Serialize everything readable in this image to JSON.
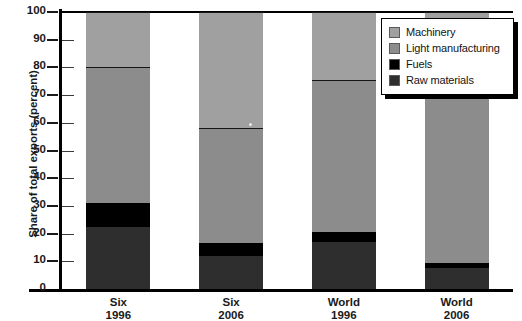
{
  "chart_data": {
    "type": "bar",
    "subtype": "stacked-bar",
    "title": "",
    "xlabel": "",
    "ylabel": "Share of total exports (percent)",
    "ylim": [
      0,
      100
    ],
    "yticks": [
      0,
      10,
      20,
      30,
      40,
      50,
      60,
      70,
      80,
      90,
      100
    ],
    "grid": false,
    "legend_position": "top-right",
    "categories": [
      "Six\n1996",
      "Six\n2006",
      "World\n1996",
      "World\n2006"
    ],
    "category_lines": [
      [
        "Six",
        "1996"
      ],
      [
        "Six",
        "2006"
      ],
      [
        "World",
        "1996"
      ],
      [
        "World",
        "2006"
      ]
    ],
    "stack_order_bottom_to_top": [
      "Raw materials",
      "Fuels",
      "Light manufacturing",
      "Machinery"
    ],
    "series": [
      {
        "name": "Raw materials",
        "color": "#2e2e2e",
        "values": [
          22.5,
          12.0,
          17.0,
          7.5
        ]
      },
      {
        "name": "Fuels",
        "color": "#000000",
        "values": [
          8.5,
          4.5,
          3.5,
          2.0
        ]
      },
      {
        "name": "Light manufacturing",
        "color": "#8c8c8c",
        "values": [
          49.0,
          41.5,
          55.0,
          60.5
        ]
      },
      {
        "name": "Machinery",
        "color": "#a0a0a0",
        "values": [
          20.0,
          42.0,
          24.5,
          30.0
        ]
      }
    ],
    "cumulative_tops": [
      {
        "category": "Six 1996",
        "raw_materials": 22.5,
        "fuels": 31.0,
        "light_manufacturing": 80.0,
        "machinery": 100
      },
      {
        "category": "Six 2006",
        "raw_materials": 12.0,
        "fuels": 16.5,
        "light_manufacturing": 58.0,
        "machinery": 100
      },
      {
        "category": "World 1996",
        "raw_materials": 17.0,
        "fuels": 20.5,
        "light_manufacturing": 75.5,
        "machinery": 100
      },
      {
        "category": "World 2006",
        "raw_materials": 7.5,
        "fuels": 9.5,
        "light_manufacturing": 70.0,
        "machinery": 100
      }
    ]
  },
  "legend": {
    "items": [
      {
        "label": "Machinery",
        "color": "#a0a0a0"
      },
      {
        "label": "Light manufacturing",
        "color": "#8c8c8c"
      },
      {
        "label": "Fuels",
        "color": "#000000"
      },
      {
        "label": "Raw materials",
        "color": "#2e2e2e"
      }
    ]
  },
  "axis": {
    "y_title": "Share of total exports (percent)",
    "y_ticks": [
      "100",
      "90",
      "80",
      "70",
      "60",
      "50",
      "40",
      "30",
      "20",
      "10",
      "0"
    ]
  },
  "colors": {
    "machinery": "#a0a0a0",
    "light_manufacturing": "#8c8c8c",
    "fuels": "#000000",
    "raw_materials": "#2e2e2e",
    "axis": "#000000",
    "background": "#ffffff",
    "text": "#1a1a1a"
  }
}
